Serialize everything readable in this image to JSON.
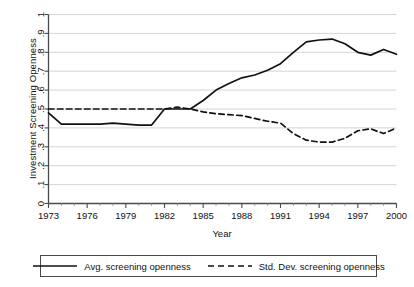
{
  "chart_data": {
    "type": "line",
    "title": "",
    "xlabel": "Year",
    "ylabel": "Investment Screening Openness",
    "xlim": [
      1973,
      2000
    ],
    "ylim": [
      0,
      1
    ],
    "grid": true,
    "x_ticks": [
      1973,
      1976,
      1979,
      1982,
      1985,
      1988,
      1991,
      1994,
      1997,
      2000
    ],
    "x_tick_labels": [
      "1973",
      "1976",
      "1979",
      "1982",
      "1985",
      "1988",
      "1991",
      "1994",
      "1997",
      "2000"
    ],
    "x_minor_ticks": [
      1974,
      1975,
      1977,
      1978,
      1980,
      1981,
      1983,
      1984,
      1986,
      1987,
      1989,
      1990,
      1992,
      1993,
      1995,
      1996,
      1998,
      1999
    ],
    "y_ticks": [
      0,
      0.1,
      0.2,
      0.3,
      0.4,
      0.5,
      0.6,
      0.7,
      0.8,
      0.9,
      1
    ],
    "y_tick_labels": [
      "0",
      ".1",
      ".2",
      ".3",
      ".4",
      ".5",
      ".6",
      ".7",
      ".8",
      ".9",
      "1"
    ],
    "legend_position": "bottom",
    "x": [
      1973,
      1974,
      1975,
      1976,
      1977,
      1978,
      1979,
      1980,
      1981,
      1982,
      1983,
      1984,
      1985,
      1986,
      1987,
      1988,
      1989,
      1990,
      1991,
      1992,
      1993,
      1994,
      1995,
      1996,
      1997,
      1998,
      1999,
      2000
    ],
    "series": [
      {
        "name": "Avg. screening openness",
        "style": "solid",
        "color": "#111111",
        "values": [
          0.48,
          0.42,
          0.42,
          0.42,
          0.42,
          0.425,
          0.42,
          0.415,
          0.415,
          0.5,
          0.5,
          0.5,
          0.545,
          0.6,
          0.635,
          0.665,
          0.68,
          0.705,
          0.74,
          0.8,
          0.855,
          0.865,
          0.87,
          0.845,
          0.8,
          0.785,
          0.815,
          0.79
        ]
      },
      {
        "name": "Std. Dev. screening openness",
        "style": "dashed",
        "color": "#111111",
        "values": [
          0.5,
          0.5,
          0.5,
          0.5,
          0.5,
          0.5,
          0.5,
          0.5,
          0.5,
          0.5,
          0.51,
          0.5,
          0.485,
          0.475,
          0.47,
          0.465,
          0.45,
          0.435,
          0.425,
          0.37,
          0.335,
          0.325,
          0.325,
          0.345,
          0.385,
          0.395,
          0.37,
          0.4
        ]
      }
    ]
  },
  "legend": {
    "entries": [
      {
        "label": "Avg. screening openness",
        "style": "solid"
      },
      {
        "label": "Std. Dev. screening openness",
        "style": "dashed"
      }
    ]
  }
}
